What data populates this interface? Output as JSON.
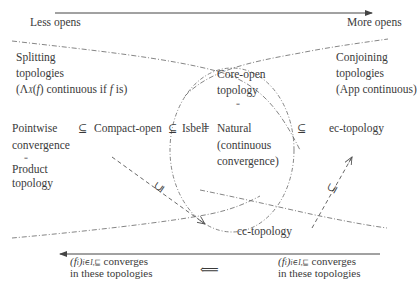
{
  "axis": {
    "left_label": "Less opens",
    "right_label": "More opens"
  },
  "regions": {
    "splitting": {
      "line1": "Splitting",
      "line2": "topologies",
      "line3": "(Λ_X(f) continuous if f is)",
      "line3_lambda": "(Λ",
      "line3_sub": "X",
      "line3_rest_a": "(",
      "line3_f": "f",
      "line3_rest_b": ") continuous if ",
      "line3_f2": "f",
      "line3_end": " is)"
    },
    "conjoining": {
      "line1": "Conjoining",
      "line2": "topologies",
      "line3": "(App continuous)"
    }
  },
  "nodes": {
    "pointwise": {
      "line1": "Pointwise",
      "line2": "convergence"
    },
    "pointwise_eq": "=",
    "product": {
      "line1": "Product",
      "line2": "topology"
    },
    "compact_open": "Compact-open",
    "isbell": "Isbell",
    "core_open": {
      "line1": "Core-open",
      "line2": "topology"
    },
    "core_eq": "=",
    "natural": {
      "line1": "Natural",
      "line2": "(continuous",
      "line3": "convergence)"
    },
    "ec_topology": "ec-topology",
    "cc_topology": "cc-topology"
  },
  "relations": {
    "pointwise_compact": "⊆",
    "compact_isbell": "⊆",
    "isbell_natural": "=",
    "natural_ec": "⊆",
    "compact_cc": "⊆",
    "cc_ec": "⊆"
  },
  "bottom": {
    "left_caption": {
      "prefix": "(f",
      "sub_i": "i",
      "close": ")",
      "sub_index": "i∈I,⊑",
      "line1_rest": " converges",
      "line2": "in these topologies"
    },
    "right_caption": {
      "prefix": "(f",
      "sub_i": "i",
      "close": ")",
      "sub_index": "i∈I,⊑",
      "line1_rest": " converges",
      "line2": "in these topologies"
    },
    "implies": "⟸"
  },
  "colors": {
    "line": "#444444",
    "text": "#3a3a3a",
    "background": "#ffffff"
  }
}
